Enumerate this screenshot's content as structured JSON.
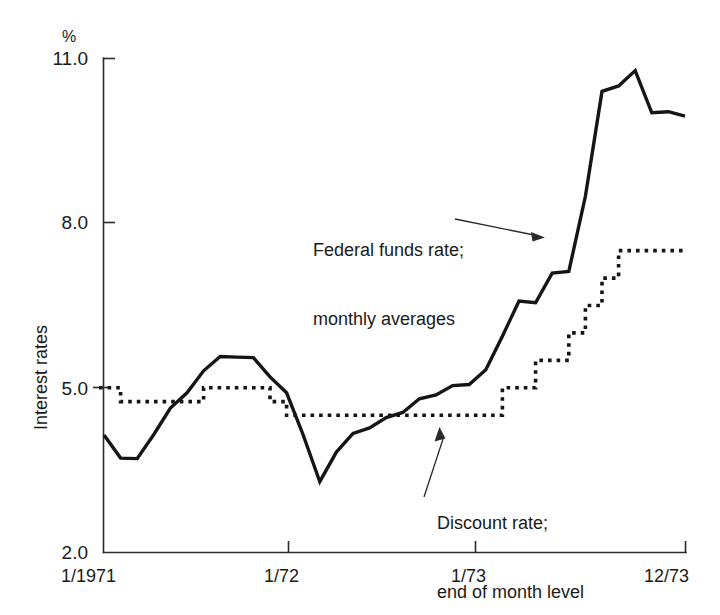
{
  "chart_data": {
    "type": "line",
    "title": "",
    "subtitle": "",
    "xlabel": "",
    "ylabel": "Interest rates",
    "yunit": "%",
    "xlim": [
      0,
      35
    ],
    "ylim": [
      2.0,
      11.0
    ],
    "grid": false,
    "legend_position": "inline-annotations",
    "y_ticks": [
      "11.0",
      "8.0",
      "5.0",
      "2.0"
    ],
    "y_tick_values": [
      11.0,
      8.0,
      5.0,
      2.0
    ],
    "x_ticks": [
      "1/1971",
      "1/72",
      "1/73",
      "12/73"
    ],
    "x_tick_values": [
      0,
      12,
      24,
      35
    ],
    "series": [
      {
        "name": "Federal funds rate; monthly averages",
        "style": "solid",
        "x": [
          0,
          1,
          2,
          3,
          4,
          5,
          6,
          7,
          8,
          9,
          10,
          11,
          12,
          13,
          14,
          15,
          16,
          17,
          18,
          19,
          20,
          21,
          22,
          23,
          24,
          25,
          26,
          27,
          28,
          29,
          30,
          31,
          32,
          33,
          34,
          35
        ],
        "values": [
          4.14,
          3.72,
          3.71,
          4.15,
          4.63,
          4.91,
          5.31,
          5.57,
          5.56,
          5.55,
          5.2,
          4.91,
          4.14,
          3.29,
          3.83,
          4.17,
          4.27,
          4.46,
          4.55,
          4.8,
          4.87,
          5.04,
          5.06,
          5.33,
          5.94,
          6.58,
          6.55,
          7.09,
          7.12,
          8.49,
          10.4,
          10.5,
          10.78,
          10.01,
          10.03,
          9.95
        ]
      },
      {
        "name": "Discount rate; end of month level",
        "style": "dotted",
        "steps": [
          {
            "x_start": 0,
            "x_end": 1,
            "value": 5.0
          },
          {
            "x_start": 1,
            "x_end": 6,
            "value": 4.75
          },
          {
            "x_start": 6,
            "x_end": 10,
            "value": 5.0
          },
          {
            "x_start": 10,
            "x_end": 11,
            "value": 4.75
          },
          {
            "x_start": 11,
            "x_end": 24,
            "value": 4.5
          },
          {
            "x_start": 24,
            "x_end": 26,
            "value": 5.0
          },
          {
            "x_start": 26,
            "x_end": 28,
            "value": 5.5
          },
          {
            "x_start": 28,
            "x_end": 29,
            "value": 6.0
          },
          {
            "x_start": 29,
            "x_end": 30,
            "value": 6.5
          },
          {
            "x_start": 30,
            "x_end": 31,
            "value": 7.0
          },
          {
            "x_start": 31,
            "x_end": 35,
            "value": 7.5
          }
        ]
      }
    ],
    "annotations": [
      {
        "id": "federal-funds",
        "line1": "Federal funds rate;",
        "line2": "monthly averages",
        "arrow": "points-right-to-curve"
      },
      {
        "id": "discount-rate",
        "line1": "Discount rate;",
        "line2": "end of month level",
        "arrow": "points-up-left-to-dotted-line"
      }
    ]
  }
}
